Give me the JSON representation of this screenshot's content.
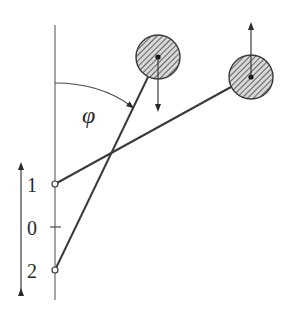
{
  "diagram": {
    "angle_label": "φ",
    "position_labels": [
      "1",
      "0",
      "2"
    ],
    "colors": {
      "stroke": "#3a3a3a",
      "hatch_fill": "#bfbfbf",
      "background": "#ffffff"
    },
    "elements": {
      "vertical_axis": "vertical-reference-line",
      "rod_from_1": "rod from pivot 1 to right ball",
      "rod_from_2": "rod from pivot 2 to left ball",
      "left_ball_arrow": "down",
      "right_ball_arrow": "up",
      "side_arrow": "double-headed vertical"
    }
  }
}
